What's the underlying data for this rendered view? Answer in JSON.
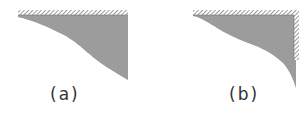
{
  "figure": {
    "panels": [
      {
        "id": "a",
        "label": "(a)",
        "description": "Shaded region under a horizontal hatched wall, bounded on the right by a vertical edge"
      },
      {
        "id": "b",
        "label": "(b)",
        "description": "Shaded region under a horizontal hatched wall with an additional vertical hatched wall on the right"
      }
    ],
    "colors": {
      "shade": "#8a8a8a",
      "hatch": "#555555",
      "label": "#333333"
    }
  }
}
